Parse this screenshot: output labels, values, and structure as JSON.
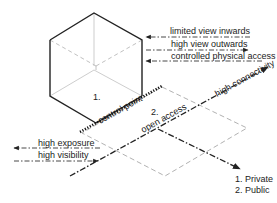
{
  "diagram": {
    "zones": {
      "private_label": "1.",
      "public_label": "2."
    },
    "boundary": {
      "control_point": "control point",
      "open_access": "open access",
      "high_connectivity": "high connectivity"
    },
    "private_arrows": [
      {
        "label": "limited view inwards",
        "direction": "inward"
      },
      {
        "label": "high view outwards",
        "direction": "outward"
      },
      {
        "label": "controlled physical access",
        "direction": "inward"
      }
    ],
    "public_arrows": [
      {
        "label": "high exposure",
        "direction": "outward"
      },
      {
        "label": "high visibility",
        "direction": "inward"
      }
    ],
    "legend": [
      "1. Private",
      "2. Public"
    ],
    "colors": {
      "line": "#222222",
      "dashed_gray": "#a0a0a0",
      "cube_inner": "#b0b0b0"
    }
  }
}
